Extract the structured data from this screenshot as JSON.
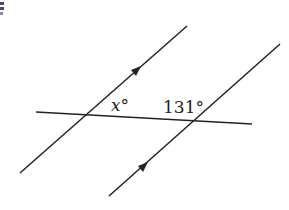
{
  "diagram": {
    "type": "parallel-lines-transversal",
    "colors": {
      "line": "#222222",
      "background": "#ffffff",
      "corner_mark": "#4a4a6a"
    },
    "lines": [
      {
        "name": "parallel-line-1",
        "x1": 20,
        "y1": 173,
        "x2": 187,
        "y2": 26,
        "arrow_at": [
          137,
          70
        ]
      },
      {
        "name": "parallel-line-2",
        "x1": 109,
        "y1": 196,
        "x2": 280,
        "y2": 44,
        "arrow_at": [
          143,
          167
        ]
      },
      {
        "name": "transversal",
        "x1": 36,
        "y1": 112,
        "x2": 252,
        "y2": 124
      }
    ],
    "labels": {
      "x_angle": "x°",
      "given_angle": "131°"
    }
  }
}
